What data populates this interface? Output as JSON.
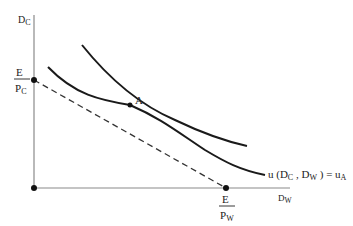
{
  "diagram": {
    "type": "indifference-curve-budget-line",
    "y_axis_label": {
      "main": "D",
      "sub": "C"
    },
    "x_axis_label": {
      "main": "D",
      "sub": "W"
    },
    "y_intercept_label": {
      "numerator": "E",
      "denominator_main": "P",
      "denominator_sub": "C"
    },
    "x_intercept_label": {
      "numerator": "E",
      "denominator_main": "P",
      "denominator_sub": "W"
    },
    "tangency_point_label": "A",
    "curve_label": {
      "prefix": "u (D",
      "sub1": "C",
      "mid": " , D",
      "sub2": "W",
      "suffix": " ) = u",
      "sub3": "A"
    },
    "colors": {
      "ink": "#1a1a1a",
      "axis": "#7a7a7a",
      "dashed": "#3a3a3a"
    }
  }
}
